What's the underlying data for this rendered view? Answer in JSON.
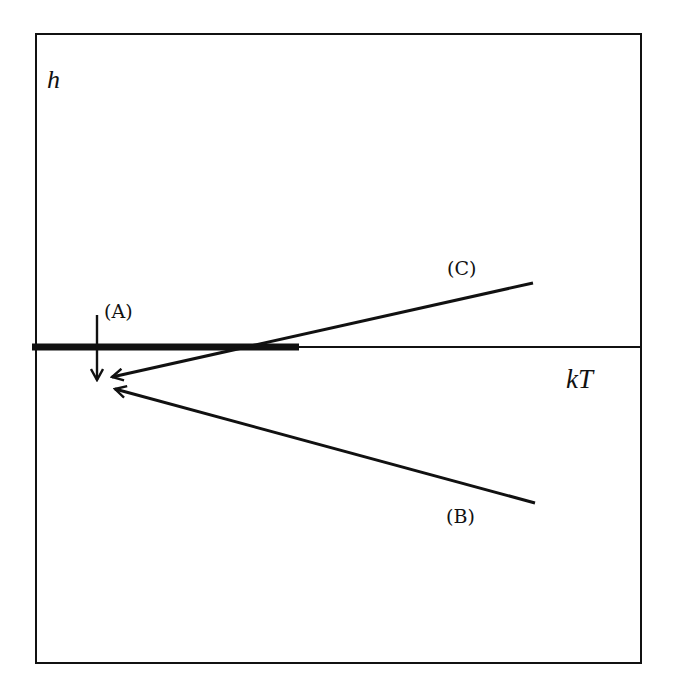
{
  "figure": {
    "axes": {
      "y_label": "h",
      "x_label": "kT"
    },
    "labels": {
      "A": "(A)",
      "B": "(B)",
      "C": "(C)"
    },
    "colors": {
      "ink": "#111111",
      "background": "#ffffff"
    },
    "elements": {
      "frame": {
        "left": 36,
        "top": 34,
        "right": 641,
        "bottom": 663
      },
      "h_axis_y": 347,
      "thick_segment": {
        "x1": 32,
        "x2": 299,
        "y": 347
      },
      "arrow_A": {
        "x": 97,
        "y1": 315,
        "y2": 382
      },
      "arrow_C": {
        "from": [
          533,
          283
        ],
        "to": [
          110,
          378
        ]
      },
      "arrow_B": {
        "from": [
          535,
          503
        ],
        "to": [
          113,
          388
        ]
      }
    }
  }
}
